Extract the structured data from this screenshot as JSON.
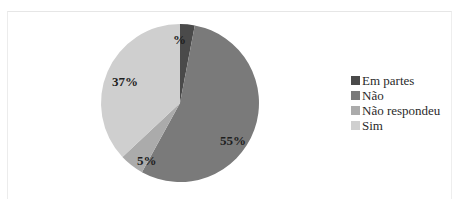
{
  "chart_data": {
    "type": "pie",
    "title": "",
    "categories": [
      "Em partes",
      "Não",
      "Não respondeu",
      "Sim"
    ],
    "values": [
      3,
      55,
      5,
      37
    ],
    "data_labels": [
      "%",
      "55%",
      "5%",
      "37%"
    ],
    "colors": [
      "#4a4a4a",
      "#7a7a7a",
      "#ababab",
      "#cfcfcf"
    ],
    "legend_position": "right",
    "start_angle_deg": 0,
    "direction": "clockwise"
  },
  "legend": {
    "items": [
      {
        "label": "Em partes",
        "color": "#4a4a4a"
      },
      {
        "label": "Não",
        "color": "#7a7a7a"
      },
      {
        "label": "Não respondeu",
        "color": "#ababab"
      },
      {
        "label": "Sim",
        "color": "#cfcfcf"
      }
    ]
  },
  "labels": {
    "em_partes": "%",
    "nao": "55%",
    "nao_respondeu": "5%",
    "sim": "37%"
  }
}
